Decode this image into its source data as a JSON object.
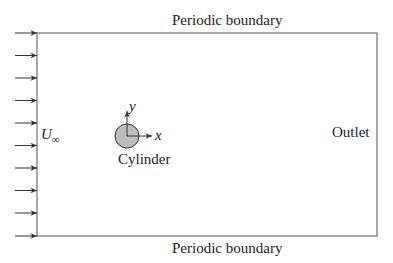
{
  "diagram": {
    "type": "flow-domain-schematic",
    "labels": {
      "top_boundary": "Periodic boundary",
      "bottom_boundary": "Periodic boundary",
      "outlet": "Outlet",
      "inflow_velocity": "U",
      "inflow_velocity_subscript": "∞",
      "body": "Cylinder",
      "x_axis": "x",
      "y_axis": "y"
    },
    "domain_box": {
      "left": 37,
      "top": 33,
      "right": 377,
      "bottom": 236
    },
    "inflow_arrows": {
      "count": 10,
      "x_start": 15,
      "x_end": 37,
      "y_positions": [
        33,
        55.5,
        78,
        100.5,
        123,
        145.5,
        168,
        190.5,
        213,
        236
      ]
    },
    "cylinder": {
      "cx": 127,
      "cy": 136,
      "r": 12,
      "fill": "#bdbdbd",
      "stroke": "#333333"
    },
    "axes": {
      "origin": [
        127,
        136
      ],
      "x_end": [
        152,
        136
      ],
      "y_end": [
        127,
        111
      ]
    },
    "colors": {
      "line": "#555555",
      "text": "#222222",
      "background": "#ffffff"
    }
  }
}
